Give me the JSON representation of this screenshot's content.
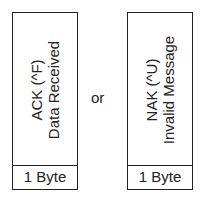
{
  "left_frame": {
    "line1": "ACK (^F)",
    "line2": "Data Received",
    "size": "1 Byte"
  },
  "connector": "or",
  "right_frame": {
    "line1": "NAK (^U)",
    "line2": "Invalid Message",
    "size": "1 Byte"
  }
}
